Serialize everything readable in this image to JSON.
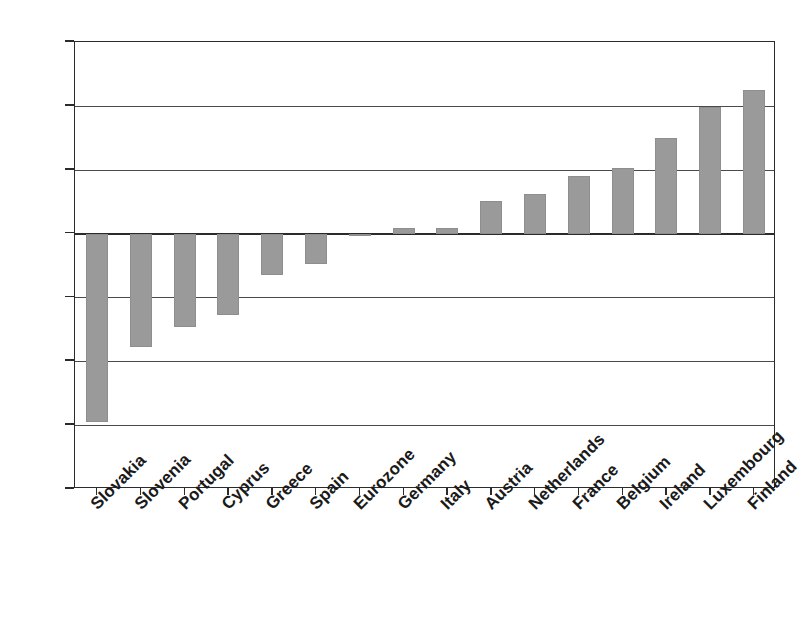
{
  "chart_data": {
    "type": "bar",
    "title": "",
    "subtitle": "",
    "xlabel": "",
    "ylabel": "",
    "ylim": [
      -40,
      30
    ],
    "yticks": [
      30,
      20,
      10,
      0,
      -10,
      -20,
      -30,
      -40
    ],
    "ytick_labels": [
      "30",
      "20",
      "10",
      "0",
      "−10",
      "−20",
      "−30",
      "−40"
    ],
    "grid": true,
    "legend": null,
    "bar_color": "#9a9a9a",
    "axis_color": "#2b2b2b",
    "categories": [
      "Slovakia",
      "Slovenia",
      "Portugal",
      "Cyprus",
      "Greece",
      "Spain",
      "Eurozone",
      "Germany",
      "Italy",
      "Austria",
      "Netherlands",
      "France",
      "Belgium",
      "Ireland",
      "Luxembourg",
      "Finland"
    ],
    "values": [
      -29.5,
      -17.8,
      -14.7,
      -12.7,
      -6.5,
      -4.7,
      -0.2,
      0.8,
      0.8,
      5.1,
      6.2,
      9.0,
      10.2,
      15.0,
      19.8,
      22.5
    ]
  }
}
